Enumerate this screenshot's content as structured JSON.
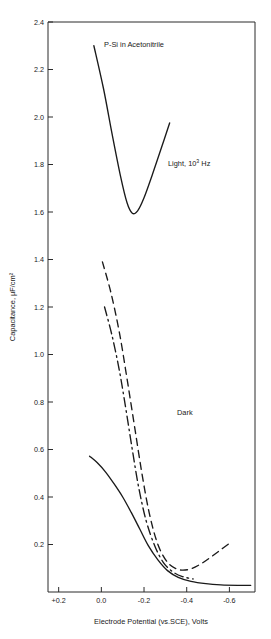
{
  "figure": {
    "title": "P-Si in Acetonitrile",
    "background": "#ffffff",
    "ink_color": "#1a1a1a"
  },
  "annotations": {
    "title_text": "P-Si in Acetonitrile",
    "light_label_main": "Light, 10",
    "light_label_exp": "3",
    "light_label_unit": " Hz",
    "light_label_full": "Light, 10³ Hz",
    "dark_label": "Dark"
  },
  "axes": {
    "x": {
      "label": "Electrode Potential (vs.SCE), Volts",
      "ticks": [
        "+0.2",
        "0.0",
        "-0.2",
        "-0.4",
        "-0.6"
      ],
      "tick_values": [
        0.2,
        0.0,
        -0.2,
        -0.4,
        -0.6
      ],
      "min": 0.25,
      "max": -0.72
    },
    "y": {
      "label": "Capacitance, μF/cm²",
      "ticks": [
        "0.2",
        "0.4",
        "0.6",
        "0.8",
        "1.0",
        "1.2",
        "1.4",
        "1.6",
        "1.8",
        "2.0",
        "2.2",
        "2.4"
      ],
      "tick_values": [
        0.2,
        0.4,
        0.6,
        0.8,
        1.0,
        1.2,
        1.4,
        1.6,
        1.8,
        2.0,
        2.2,
        2.4
      ],
      "min": 0.0,
      "max": 2.4
    }
  },
  "chart_data": {
    "type": "line",
    "title": "P-Si in Acetonitrile",
    "xlabel": "Electrode Potential (vs.SCE), Volts",
    "ylabel": "Capacitance, μF/cm²",
    "xlim": [
      0.25,
      -0.72
    ],
    "ylim": [
      0.0,
      2.4
    ],
    "grid": false,
    "legend": "none",
    "x_ticks": [
      0.2,
      0.0,
      -0.2,
      -0.4,
      -0.6
    ],
    "y_ticks": [
      0.2,
      0.4,
      0.6,
      0.8,
      1.0,
      1.2,
      1.4,
      1.6,
      1.8,
      2.0,
      2.2,
      2.4
    ],
    "annotations": [
      {
        "text": "P-Si in Acetonitrile",
        "x": 0.02,
        "y": 2.29
      },
      {
        "text": "Light, 10³ Hz",
        "x": -0.27,
        "y": 1.86
      },
      {
        "text": "Dark",
        "x": -0.33,
        "y": 0.9
      }
    ],
    "series": [
      {
        "name": "Light, 10^3 Hz",
        "style": "solid",
        "points": [
          {
            "x": 0.035,
            "y": 2.3
          },
          {
            "x": -0.01,
            "y": 2.12
          },
          {
            "x": -0.05,
            "y": 1.93
          },
          {
            "x": -0.09,
            "y": 1.75
          },
          {
            "x": -0.12,
            "y": 1.64
          },
          {
            "x": -0.145,
            "y": 1.595
          },
          {
            "x": -0.17,
            "y": 1.605
          },
          {
            "x": -0.2,
            "y": 1.66
          },
          {
            "x": -0.24,
            "y": 1.76
          },
          {
            "x": -0.285,
            "y": 1.88
          },
          {
            "x": -0.32,
            "y": 1.975
          }
        ]
      },
      {
        "name": "Dark dashed branch",
        "style": "dashed",
        "points": [
          {
            "x": -0.005,
            "y": 1.39
          },
          {
            "x": -0.045,
            "y": 1.26
          },
          {
            "x": -0.085,
            "y": 1.09
          },
          {
            "x": -0.12,
            "y": 0.9
          },
          {
            "x": -0.155,
            "y": 0.7
          },
          {
            "x": -0.19,
            "y": 0.5
          },
          {
            "x": -0.225,
            "y": 0.33
          },
          {
            "x": -0.265,
            "y": 0.2
          },
          {
            "x": -0.31,
            "y": 0.125
          },
          {
            "x": -0.36,
            "y": 0.095
          },
          {
            "x": -0.41,
            "y": 0.095
          },
          {
            "x": -0.46,
            "y": 0.115
          },
          {
            "x": -0.51,
            "y": 0.145
          },
          {
            "x": -0.56,
            "y": 0.178
          },
          {
            "x": -0.6,
            "y": 0.205
          }
        ]
      },
      {
        "name": "Dark dash-dot branch",
        "style": "dash-dot",
        "points": [
          {
            "x": -0.015,
            "y": 1.2
          },
          {
            "x": -0.05,
            "y": 1.08
          },
          {
            "x": -0.085,
            "y": 0.93
          },
          {
            "x": -0.115,
            "y": 0.77
          },
          {
            "x": -0.145,
            "y": 0.6
          },
          {
            "x": -0.175,
            "y": 0.44
          },
          {
            "x": -0.21,
            "y": 0.3
          },
          {
            "x": -0.25,
            "y": 0.195
          },
          {
            "x": -0.29,
            "y": 0.125
          },
          {
            "x": -0.335,
            "y": 0.085
          },
          {
            "x": -0.38,
            "y": 0.065
          },
          {
            "x": -0.43,
            "y": 0.055
          }
        ]
      },
      {
        "name": "Dark solid branch",
        "style": "solid",
        "points": [
          {
            "x": 0.055,
            "y": 0.572
          },
          {
            "x": 0.02,
            "y": 0.545
          },
          {
            "x": -0.02,
            "y": 0.505
          },
          {
            "x": -0.06,
            "y": 0.455
          },
          {
            "x": -0.1,
            "y": 0.4
          },
          {
            "x": -0.14,
            "y": 0.335
          },
          {
            "x": -0.18,
            "y": 0.265
          },
          {
            "x": -0.22,
            "y": 0.195
          },
          {
            "x": -0.265,
            "y": 0.135
          },
          {
            "x": -0.31,
            "y": 0.09
          },
          {
            "x": -0.36,
            "y": 0.062
          },
          {
            "x": -0.42,
            "y": 0.045
          },
          {
            "x": -0.49,
            "y": 0.035
          },
          {
            "x": -0.56,
            "y": 0.03
          },
          {
            "x": -0.64,
            "y": 0.028
          },
          {
            "x": -0.7,
            "y": 0.028
          }
        ]
      }
    ]
  }
}
